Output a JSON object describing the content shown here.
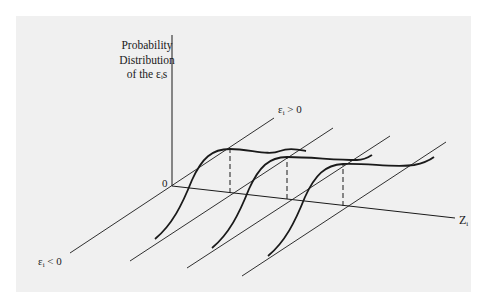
{
  "figure": {
    "y_axis_label": [
      "Probability",
      "Distribution",
      "of the εᵢs"
    ],
    "origin_label": "0",
    "z_axis_label": {
      "main": "Z",
      "sub": "i"
    },
    "epsilon_positive_label": {
      "sym": "ε",
      "sub": "i",
      "rel": " > 0"
    },
    "epsilon_negative_label": {
      "sym": "ε",
      "sub": "i",
      "rel": " < 0"
    },
    "colors": {
      "panel_background": "#f0f0f0",
      "line": "#1a1a1a"
    },
    "curve_count": 3
  }
}
